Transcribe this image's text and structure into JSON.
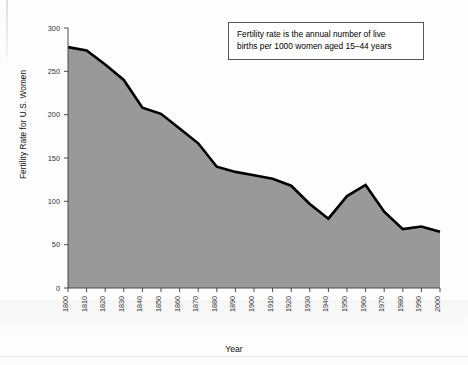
{
  "chart_data": {
    "type": "area",
    "title": "",
    "xlabel": "Year",
    "ylabel": "Fertility Rate for U.S. Women",
    "xlim": [
      1800,
      2000
    ],
    "ylim": [
      0,
      300
    ],
    "grid": false,
    "legend": null,
    "fill_color": "#999999",
    "line_color": "#000000",
    "categories": [
      1800,
      1810,
      1820,
      1830,
      1840,
      1850,
      1860,
      1870,
      1880,
      1890,
      1900,
      1910,
      1920,
      1930,
      1940,
      1950,
      1960,
      1970,
      1980,
      1990,
      2000
    ],
    "values": [
      278,
      274,
      258,
      240,
      208,
      201,
      184,
      167,
      140,
      134,
      130,
      126,
      118,
      97,
      80,
      106,
      119,
      88,
      68,
      71,
      65
    ],
    "y_ticks": [
      0,
      50,
      100,
      150,
      200,
      250,
      300
    ],
    "x_ticks": [
      "1800",
      "1810",
      "1820",
      "1830",
      "1840",
      "1850",
      "1860",
      "1870",
      "1880",
      "1890",
      "1900",
      "1910",
      "1920",
      "1930",
      "1940",
      "1950",
      "1960",
      "1970",
      "1980",
      "1990",
      "2000"
    ],
    "annotation": {
      "line1": "Fertility rate is the annual number of live",
      "line2": "births per 1000 women aged 15–44 years"
    }
  }
}
